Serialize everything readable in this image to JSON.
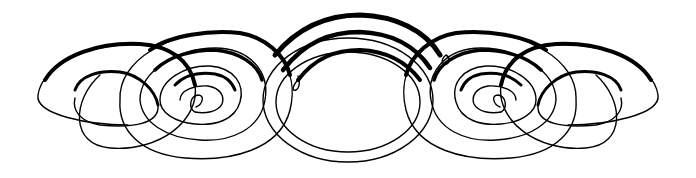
{
  "artwork": {
    "type": "calligraphic flourish ornament",
    "ink_color": "#000000",
    "background_color": "#ffffff",
    "description": "Symmetrical ornament of interlocking spiral loops with a large central oval"
  }
}
